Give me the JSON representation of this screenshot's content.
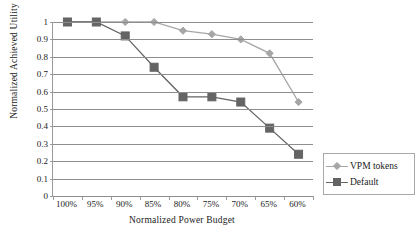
{
  "chart_data": {
    "type": "line",
    "title": "",
    "xlabel": "Normalized Power Budget",
    "ylabel": "Normalized Achieved Utility",
    "categories": [
      "100%",
      "95%",
      "90%",
      "85%",
      "80%",
      "75%",
      "70%",
      "65%",
      "60%"
    ],
    "ylim": [
      0,
      1
    ],
    "yticks": [
      "0",
      "0.1",
      "0.2",
      "0.3",
      "0.4",
      "0.5",
      "0.6",
      "0.7",
      "0.8",
      "0.9",
      "1"
    ],
    "grid": "horizontal",
    "legend_position": "right",
    "series": [
      {
        "name": "VPM tokens",
        "color": "#a6a6a6",
        "marker": "diamond",
        "values": [
          1,
          1,
          1,
          1,
          0.95,
          0.93,
          0.9,
          0.82,
          0.54
        ]
      },
      {
        "name": "Default",
        "color": "#646464",
        "marker": "square",
        "values": [
          1,
          1,
          0.92,
          0.74,
          0.57,
          0.57,
          0.54,
          0.39,
          0.24
        ]
      }
    ]
  },
  "axes": {
    "y_title": "Normalized Achieved Utility",
    "x_title": "Normalized Power Budget"
  },
  "legend": {
    "items": [
      {
        "label": "VPM tokens"
      },
      {
        "label": "Default"
      }
    ]
  },
  "colors": {
    "series_vpm": "#a6a6a6",
    "series_default": "#646464",
    "grid": "#8e8e8e",
    "axis": "#9a9a9a",
    "text": "#1a1a1a",
    "background": "#ffffff"
  }
}
